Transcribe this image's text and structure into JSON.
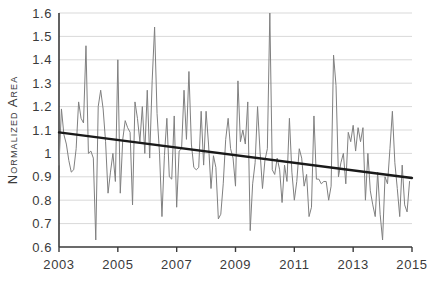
{
  "chart_data": {
    "type": "line",
    "title": "",
    "xlabel": "",
    "ylabel": "Normalized Area",
    "xlim": [
      2003,
      2015
    ],
    "ylim": [
      0.6,
      1.6
    ],
    "grid": true,
    "legend": false,
    "x_tick_labels": [
      "2003",
      "2005",
      "2007",
      "2009",
      "2011",
      "2013",
      "2015"
    ],
    "x_tick_values": [
      2003,
      2005,
      2007,
      2009,
      2011,
      2013,
      2015
    ],
    "y_tick_labels": [
      "1.6",
      "1.5",
      "1.4",
      "1.3",
      "1.2",
      "1.1",
      "1",
      "0.9",
      "0.8",
      "0.7",
      "0.6"
    ],
    "y_tick_values": [
      1.6,
      1.5,
      1.4,
      1.3,
      1.2,
      1.1,
      1.0,
      0.9,
      0.8,
      0.7,
      0.6
    ],
    "series": [
      {
        "name": "Normalized Area",
        "kind": "line",
        "color": "#808080",
        "x": [
          2003.0,
          2003.083,
          2003.167,
          2003.25,
          2003.333,
          2003.417,
          2003.5,
          2003.583,
          2003.667,
          2003.75,
          2003.833,
          2003.917,
          2004.0,
          2004.083,
          2004.167,
          2004.25,
          2004.333,
          2004.417,
          2004.5,
          2004.583,
          2004.667,
          2004.75,
          2004.833,
          2004.917,
          2005.0,
          2005.083,
          2005.167,
          2005.25,
          2005.333,
          2005.417,
          2005.5,
          2005.583,
          2005.667,
          2005.75,
          2005.833,
          2005.917,
          2006.0,
          2006.083,
          2006.167,
          2006.25,
          2006.333,
          2006.417,
          2006.5,
          2006.583,
          2006.667,
          2006.75,
          2006.833,
          2006.917,
          2007.0,
          2007.083,
          2007.167,
          2007.25,
          2007.333,
          2007.417,
          2007.5,
          2007.583,
          2007.667,
          2007.75,
          2007.833,
          2007.917,
          2008.0,
          2008.083,
          2008.167,
          2008.25,
          2008.333,
          2008.417,
          2008.5,
          2008.583,
          2008.667,
          2008.75,
          2008.833,
          2008.917,
          2009.0,
          2009.083,
          2009.167,
          2009.25,
          2009.333,
          2009.417,
          2009.5,
          2009.583,
          2009.667,
          2009.75,
          2009.833,
          2009.917,
          2010.0,
          2010.083,
          2010.167,
          2010.25,
          2010.333,
          2010.417,
          2010.5,
          2010.583,
          2010.667,
          2010.75,
          2010.833,
          2010.917,
          2011.0,
          2011.083,
          2011.167,
          2011.25,
          2011.333,
          2011.417,
          2011.5,
          2011.583,
          2011.667,
          2011.75,
          2011.833,
          2011.917,
          2012.0,
          2012.083,
          2012.167,
          2012.25,
          2012.333,
          2012.417,
          2012.5,
          2012.583,
          2012.667,
          2012.75,
          2012.833,
          2012.917,
          2013.0,
          2013.083,
          2013.167,
          2013.25,
          2013.333,
          2013.417,
          2013.5,
          2013.583,
          2013.667,
          2013.75,
          2013.833,
          2013.917,
          2014.0,
          2014.083,
          2014.167,
          2014.25,
          2014.333,
          2014.417,
          2014.5,
          2014.583,
          2014.667,
          2014.75,
          2014.833,
          2014.917
        ],
        "values": [
          0.95,
          1.19,
          1.08,
          1.04,
          0.97,
          0.92,
          0.93,
          1.02,
          1.22,
          1.15,
          1.13,
          1.46,
          1.0,
          1.01,
          0.98,
          0.63,
          1.2,
          1.27,
          1.19,
          1.05,
          0.83,
          0.92,
          1.0,
          0.88,
          1.4,
          0.83,
          1.06,
          1.14,
          1.11,
          1.09,
          0.78,
          1.22,
          1.15,
          1.05,
          1.2,
          1.0,
          1.27,
          0.98,
          1.31,
          1.54,
          1.17,
          1.0,
          0.73,
          0.99,
          1.15,
          0.9,
          0.89,
          1.16,
          0.77,
          1.01,
          1.02,
          1.27,
          1.06,
          1.35,
          1.04,
          0.94,
          0.93,
          0.94,
          1.18,
          0.95,
          1.18,
          1.04,
          0.85,
          0.99,
          0.94,
          0.72,
          0.74,
          0.87,
          1.06,
          1.15,
          1.02,
          0.98,
          0.86,
          1.31,
          1.05,
          1.1,
          1.04,
          1.22,
          0.67,
          0.87,
          0.96,
          1.2,
          1.01,
          0.85,
          0.97,
          1.02,
          1.6,
          0.93,
          0.91,
          0.98,
          0.93,
          0.79,
          0.95,
          0.88,
          1.15,
          0.92,
          0.8,
          0.88,
          1.02,
          0.98,
          0.86,
          0.91,
          0.73,
          0.77,
          1.16,
          0.89,
          0.89,
          0.87,
          0.88,
          0.88,
          0.8,
          0.86,
          1.42,
          1.29,
          0.9,
          0.96,
          1.0,
          0.87,
          1.09,
          1.05,
          1.12,
          1.01,
          1.11,
          1.05,
          1.11,
          0.8,
          1.0,
          0.84,
          0.78,
          0.73,
          0.92,
          0.74,
          0.63,
          0.9,
          0.87,
          1.02,
          1.18,
          0.96,
          0.85,
          0.73,
          0.95,
          0.78,
          0.75,
          0.88
        ]
      },
      {
        "name": "Linear trend",
        "kind": "trendline",
        "color": "#1a1a1a",
        "x": [
          2003.0,
          2015.0
        ],
        "values": [
          1.09,
          0.895
        ]
      }
    ]
  },
  "axes": {
    "y_axis_title": "Normalized Area"
  }
}
